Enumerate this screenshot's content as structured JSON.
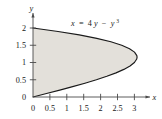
{
  "figure": {
    "background_color": "#ffffff",
    "region_fill_color": "#e3e0da",
    "curve_color": "#1a1a1a",
    "axis_color": "#4a4a4a",
    "equation_label": {
      "lhs": "x",
      "equals": "=",
      "term1_coef": "4",
      "term1_var": "y",
      "minus": "−",
      "term2_var": "y",
      "term2_exp": "3",
      "full_text": "x = 4y − y³"
    },
    "x_axis": {
      "label": "x",
      "ticks": [
        "0",
        "0.5",
        "1",
        "1.5",
        "2",
        "2.5",
        "3"
      ],
      "tick_values": [
        0,
        0.5,
        1,
        1.5,
        2,
        2.5,
        3
      ],
      "range": [
        0,
        3.45
      ]
    },
    "y_axis": {
      "label": "y",
      "ticks": [
        "0",
        "0.5",
        "1",
        "1.5",
        "2"
      ],
      "tick_values": [
        0,
        0.5,
        1,
        1.5,
        2
      ],
      "range": [
        0,
        2.25
      ]
    }
  },
  "chart_data": {
    "type": "line",
    "title": "",
    "xlabel": "x",
    "ylabel": "y",
    "xlim": [
      0,
      3.45
    ],
    "ylim": [
      0,
      2.25
    ],
    "grid": false,
    "legend": "none",
    "annotations": [
      {
        "text": "x = 4y − y³",
        "x": 1.9,
        "y": 2.08
      }
    ],
    "xticks": [
      0,
      0.5,
      1,
      1.5,
      2,
      2.5,
      3
    ],
    "xticklabels": [
      "0",
      "0.5",
      "1",
      "1.5",
      "2",
      "2.5",
      "3"
    ],
    "yticks": [
      0,
      0.5,
      1,
      1.5,
      2
    ],
    "yticklabels": [
      "0",
      "0.5",
      "1",
      "1.5",
      "2"
    ],
    "series": [
      {
        "name": "x = 4y - y^3",
        "equation": "x = 4y - y^3",
        "parametric_variable": "y",
        "filled": true,
        "fill_between": "curve and y-axis",
        "fill_color": "#e3e0da",
        "y": [
          0,
          0.1,
          0.2,
          0.3,
          0.4,
          0.5,
          0.6,
          0.7,
          0.8,
          0.9,
          1.0,
          1.1,
          1.1547,
          1.2,
          1.3,
          1.4,
          1.5,
          1.6,
          1.7,
          1.8,
          1.9,
          2.0
        ],
        "x": [
          0,
          0.399,
          0.792,
          1.173,
          1.536,
          1.875,
          2.184,
          2.457,
          2.688,
          2.871,
          3.0,
          3.069,
          3.0792,
          3.072,
          3.003,
          2.856,
          2.625,
          2.304,
          1.887,
          1.368,
          0.741,
          0
        ]
      }
    ],
    "key_points": [
      {
        "label": "origin",
        "x": 0,
        "y": 0
      },
      {
        "label": "max x",
        "x": 3.0792,
        "y": 1.1547
      },
      {
        "label": "upper intercept",
        "x": 0,
        "y": 2
      }
    ]
  }
}
